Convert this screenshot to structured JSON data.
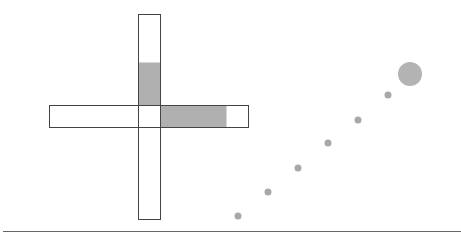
{
  "canvas": {
    "width": 461,
    "height": 240,
    "background": "#ffffff"
  },
  "colors": {
    "outline": "#444444",
    "fill": "#b0b0b0",
    "dot": "#a8a8a8",
    "big_dot": "#b3b3b3",
    "baseline": "#666666"
  },
  "cross": {
    "vertical_bar": {
      "x": 138,
      "y": 14,
      "width": 22,
      "height": 205
    },
    "vertical_fill": {
      "x": 138,
      "y": 62,
      "width": 22,
      "height": 43
    },
    "horizontal_bar": {
      "x": 49,
      "y": 105,
      "width": 199,
      "height": 22
    },
    "horizontal_fill": {
      "x": 160,
      "y": 105,
      "width": 66,
      "height": 22
    }
  },
  "dots": [
    {
      "cx": 238,
      "cy": 216,
      "r": 3.5
    },
    {
      "cx": 268,
      "cy": 192,
      "r": 3.5
    },
    {
      "cx": 298,
      "cy": 168,
      "r": 3.5
    },
    {
      "cx": 328,
      "cy": 143,
      "r": 3.5
    },
    {
      "cx": 358,
      "cy": 120,
      "r": 3.5
    },
    {
      "cx": 388,
      "cy": 95,
      "r": 3.5
    }
  ],
  "big_dot": {
    "cx": 410,
    "cy": 74,
    "r": 12
  },
  "baseline": {
    "x1": 3,
    "y1": 231.5,
    "x2": 461,
    "y2": 231.5
  }
}
